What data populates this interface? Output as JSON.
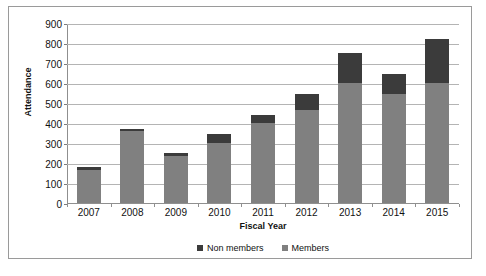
{
  "chart_data": {
    "type": "bar",
    "stacked": true,
    "title": "",
    "xlabel": "Fiscal Year",
    "ylabel": "Attendance",
    "categories": [
      "2007",
      "2008",
      "2009",
      "2010",
      "2011",
      "2012",
      "2013",
      "2014",
      "2015"
    ],
    "series": [
      {
        "name": "Members",
        "color": "#808080",
        "values": [
          165,
          360,
          235,
          300,
          400,
          465,
          600,
          545,
          600
        ]
      },
      {
        "name": "Non members",
        "color": "#3b3b3b",
        "values": [
          15,
          10,
          15,
          45,
          40,
          80,
          150,
          100,
          220
        ]
      }
    ],
    "totals": [
      180,
      370,
      250,
      345,
      440,
      545,
      750,
      645,
      820
    ],
    "ylim": [
      0,
      900
    ],
    "ytick_step": 100,
    "yticks": [
      "900",
      "800",
      "700",
      "600",
      "500",
      "400",
      "300",
      "200",
      "100",
      "0"
    ],
    "grid": true,
    "legend_position": "bottom",
    "legend": [
      {
        "label": "Non members",
        "color": "#3b3b3b"
      },
      {
        "label": "Members",
        "color": "#808080"
      }
    ]
  },
  "axes": {
    "y_title": "Attendance",
    "x_title": "Fiscal Year"
  }
}
